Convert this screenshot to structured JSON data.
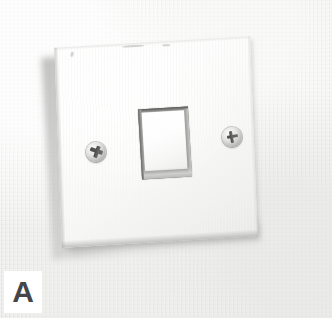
{
  "figure": {
    "panel_label": "A",
    "background_color": "#ececea",
    "plate_color": "#fbfbfa",
    "switch_color": "#ffffff",
    "label_text_color": "#45454a",
    "label_box_color": "#ffffff"
  },
  "parts": {
    "faceplate_name": "switch-faceplate",
    "rocker_name": "rocker-switch",
    "screw_left_name": "mounting-screw-left",
    "screw_right_name": "mounting-screw-right",
    "wall_name": "wall-background"
  }
}
